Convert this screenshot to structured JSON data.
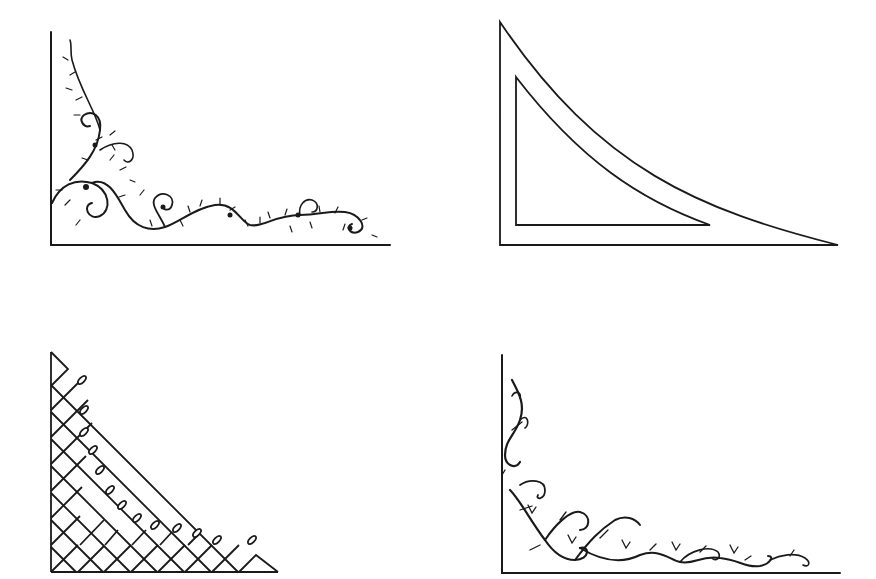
{
  "canvas": {
    "width": 876,
    "height": 579,
    "background": "#ffffff",
    "ink": "#1a1a1a"
  },
  "ornaments": [
    {
      "id": "vine-corner",
      "position": "top-left",
      "style": "leafy scrolling vine with buds"
    },
    {
      "id": "triangle-corner",
      "position": "top-right",
      "style": "curved double-outline triangle"
    },
    {
      "id": "lattice-corner",
      "position": "bottom-left",
      "style": "diagonal lattice with spear tips"
    },
    {
      "id": "scroll-corner",
      "position": "bottom-right",
      "style": "curling tendrils with bell flowers"
    }
  ]
}
